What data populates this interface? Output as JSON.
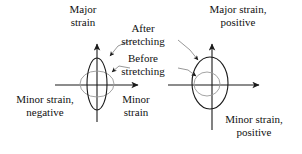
{
  "figure": {
    "background_color": "#ffffff",
    "line_color": "#1a1a1a",
    "faint_line_color": "#9a9a9a",
    "labels": {
      "major_strain": "Major\nstrain",
      "after_stretching": "After\nstretching",
      "before_stretching": "Before\nstretching",
      "major_strain_positive": "Major strain,\npositive",
      "minor_strain_negative": "Minor strain,\nnegative",
      "minor_strain": "Minor\nstrain",
      "minor_strain_positive": "Minor strain,\npositive"
    },
    "left_diagram": {
      "name": "negative-minor-strain-diagram",
      "axis_origin": [
        97,
        85
      ],
      "x_axis": [
        55,
        141
      ],
      "y_axis": [
        42,
        122
      ],
      "after_ellipse": {
        "cx": 97,
        "cy": 84,
        "rx": 10,
        "ry": 26
      },
      "before_ellipse": {
        "cx": 97,
        "cy": 84,
        "rx": 17,
        "ry": 13
      }
    },
    "right_diagram": {
      "name": "positive-minor-strain-diagram",
      "axis_origin": [
        212,
        85
      ],
      "x_axis": [
        168,
        262
      ],
      "y_axis": [
        42,
        130
      ],
      "after_ellipse": {
        "cx": 210,
        "cy": 83,
        "rx": 18,
        "ry": 26
      },
      "before_ellipse": {
        "cx": 207,
        "cy": 84,
        "rx": 13,
        "ry": 12
      }
    }
  }
}
